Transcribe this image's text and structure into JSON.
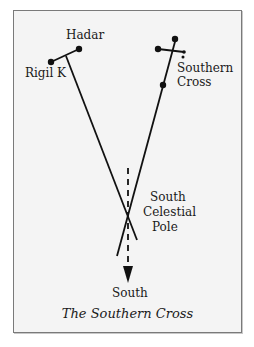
{
  "diagram": {
    "caption": "The Southern Cross",
    "labels": {
      "hadar": "Hadar",
      "rigil_k": "Rigil K",
      "southern_cross_line1": "Southern",
      "southern_cross_line2": "Cross",
      "pole_line1": "South",
      "pole_line2": "Celestial",
      "pole_line3": "Pole",
      "south": "South"
    },
    "colors": {
      "background": "#f4f4f4",
      "ink": "#111111",
      "border": "#7a7a7a"
    }
  }
}
